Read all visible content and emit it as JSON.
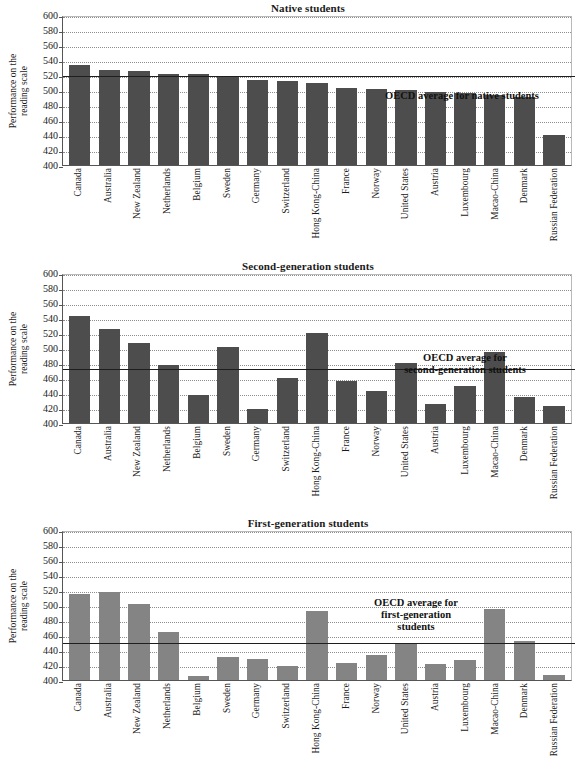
{
  "chart_data": [
    {
      "type": "bar",
      "title": "Native students",
      "ylabel": "Performance on the\nreading scale",
      "xlabel": "",
      "ylim": [
        400,
        600
      ],
      "yticks": [
        400,
        420,
        440,
        460,
        480,
        500,
        520,
        540,
        560,
        580,
        600
      ],
      "grid": true,
      "legend": "none",
      "bar_color": "#4d4d4d",
      "categories": [
        "Canada",
        "Australia",
        "New Zealand",
        "Netherlands",
        "Belgium",
        "Sweden",
        "Germany",
        "Switzerland",
        "Hong Kong-China",
        "France",
        "Norway",
        "United States",
        "Austria",
        "Luxembourg",
        "Macao-China",
        "Denmark",
        "Russian Federation"
      ],
      "values": [
        533,
        527,
        526,
        522,
        521,
        519,
        514,
        512,
        510,
        503,
        501,
        500,
        498,
        496,
        494,
        491,
        440
      ],
      "annotations": [
        {
          "text": "OECD average for native students",
          "value": 521,
          "kind": "reference-line"
        }
      ]
    },
    {
      "type": "bar",
      "title": "Second-generation students",
      "ylabel": "Performance on the\nreading scale",
      "xlabel": "",
      "ylim": [
        400,
        600
      ],
      "yticks": [
        400,
        420,
        440,
        460,
        480,
        500,
        520,
        540,
        560,
        580,
        600
      ],
      "grid": true,
      "legend": "none",
      "bar_color": "#4d4d4d",
      "categories": [
        "Canada",
        "Australia",
        "New Zealand",
        "Netherlands",
        "Belgium",
        "Sweden",
        "Germany",
        "Switzerland",
        "Hong Kong-China",
        "France",
        "Norway",
        "United States",
        "Austria",
        "Luxembourg",
        "Macao-China",
        "Denmark",
        "Russian Federation"
      ],
      "values": [
        543,
        525,
        507,
        477,
        438,
        501,
        419,
        460,
        520,
        456,
        443,
        480,
        425,
        450,
        495,
        435,
        423
      ],
      "annotations": [
        {
          "text": "OECD average for\nsecond-generation students",
          "value": 475,
          "kind": "reference-line"
        }
      ]
    },
    {
      "type": "bar",
      "title": "First-generation students",
      "ylabel": "Performance on the\nreading scale",
      "xlabel": "",
      "ylim": [
        400,
        600
      ],
      "yticks": [
        400,
        420,
        440,
        460,
        480,
        500,
        520,
        540,
        560,
        580,
        600
      ],
      "grid": true,
      "legend": "none",
      "bar_color": "#848484",
      "categories": [
        "Canada",
        "Australia",
        "New Zealand",
        "Netherlands",
        "Belgium",
        "Sweden",
        "Germany",
        "Switzerland",
        "Hong Kong-China",
        "France",
        "Norway",
        "United States",
        "Austria",
        "Luxembourg",
        "Macao-China",
        "Denmark",
        "Russian Federation"
      ],
      "values": [
        515,
        517,
        502,
        464,
        405,
        431,
        428,
        419,
        492,
        423,
        433,
        450,
        421,
        427,
        495,
        452,
        407
      ],
      "annotations": [
        {
          "text": "OECD average for\nfirst-generation\nstudents",
          "value": 452,
          "kind": "reference-line"
        }
      ]
    }
  ],
  "panels": [
    {
      "title": "Native students",
      "ylabel_line1": "Performance on the",
      "ylabel_line2": "reading scale",
      "avg_label_lines": [
        "OECD average for native students"
      ],
      "avg_value": 521,
      "avg_label_left": 352,
      "avg_label_top": 74,
      "avg_label_width": 220,
      "bar_style": "dark"
    },
    {
      "title": "Second-generation students",
      "ylabel_line1": "Performance on the",
      "ylabel_line2": "reading scale",
      "avg_label_lines": [
        "OECD average for",
        "second-generation students"
      ],
      "avg_value": 475,
      "avg_label_left": 358,
      "avg_label_top": 78,
      "avg_label_width": 214,
      "bar_style": "dark"
    },
    {
      "title": "First-generation students",
      "ylabel_line1": "Performance on the",
      "ylabel_line2": "reading scale",
      "avg_label_lines": [
        "OECD average for",
        "first-generation",
        "students"
      ],
      "avg_value": 452,
      "avg_label_left": 326,
      "avg_label_top": 66,
      "avg_label_width": 180,
      "bar_style": "light"
    }
  ]
}
